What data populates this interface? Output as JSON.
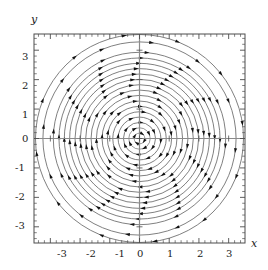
{
  "figure": {
    "kind": "phase-portrait-stream-plot",
    "background_color": "#ffffff",
    "frame_color": "#4d4d4d",
    "axis_color": "#808080",
    "streamline_color": "#555555",
    "arrow_color": "#111111",
    "x_axis_label": "x",
    "y_axis_label": "y"
  },
  "axes": {
    "x_tick_labels": [
      "-3",
      "-2",
      "-1",
      "0",
      "1",
      "2",
      "3"
    ],
    "y_tick_labels": [
      "3",
      "2",
      "1",
      "0",
      "-1",
      "-2",
      "-3"
    ]
  },
  "chart_data": {
    "type": "scatter",
    "title": "",
    "subtitle": "",
    "xlabel": "x",
    "ylabel": "y",
    "xlim": [
      -3.55,
      3.55
    ],
    "ylim": [
      -3.55,
      3.55
    ],
    "xticks": [
      -3,
      -2,
      -1,
      0,
      1,
      2,
      3
    ],
    "yticks": [
      -3,
      -2,
      -1,
      0,
      1,
      2,
      3
    ],
    "xticklabels": [
      "-3",
      "-2",
      "-1",
      "0",
      "1",
      "2",
      "3"
    ],
    "yticklabels": [
      "-3",
      "-2",
      "-1",
      "0",
      "1",
      "2",
      "3"
    ],
    "minor_ticks_per_interval": 5,
    "grid": false,
    "legend": null,
    "legend_position": "none",
    "frame": true,
    "axis_lines_at_zero": true,
    "plot_kind": "streamplot",
    "vector_field": {
      "description": "Linear center: trajectories are concentric circles traversed clockwise",
      "u_expression": "y",
      "v_expression": "-x",
      "rotation": "clockwise",
      "fixed_point": [
        0,
        0
      ],
      "fixed_point_type": "center"
    },
    "streamlines": {
      "shape": "circle",
      "center": [
        0,
        0
      ],
      "count": 18,
      "radii": [
        0.18,
        0.36,
        0.54,
        0.72,
        0.9,
        1.08,
        1.26,
        1.45,
        1.63,
        1.81,
        1.99,
        2.17,
        2.35,
        2.53,
        2.71,
        2.9,
        3.25,
        3.5
      ],
      "full_circle_max_radius": 2.9,
      "corner_arc_radii": [
        3.25,
        3.5
      ],
      "arrowheads_per_circle": 12,
      "arrow_direction": "clockwise"
    }
  }
}
